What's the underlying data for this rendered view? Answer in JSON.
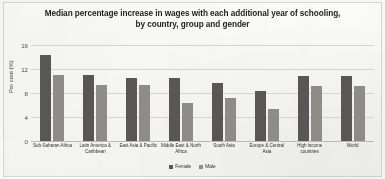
{
  "chart_data": {
    "type": "bar",
    "title": "Median percentage increase in wages with each additional year of schooling, by country, group and gender",
    "title_lines": [
      "Median percentage increase in wages with each additional year of schooling,",
      "by country, group and gender"
    ],
    "xlabel": "",
    "ylabel": "Per cent (%)",
    "ylim": [
      0,
      16
    ],
    "yticks": [
      0,
      4,
      8,
      12,
      16
    ],
    "ytick_labels": [
      "0",
      "4",
      "8",
      "12",
      "16"
    ],
    "grid": true,
    "legend_position": "bottom",
    "categories": [
      "Sub-Saharan Africa",
      "Latin America & Caribbean",
      "East Asia & Pacific",
      "Middle East & North Africa",
      "South Asia",
      "Europe & Central Asia",
      "High income countries",
      "World"
    ],
    "series": [
      {
        "name": "Female",
        "color": "#595755",
        "values": [
          14.3,
          11.0,
          10.5,
          10.5,
          9.7,
          8.4,
          10.8,
          10.8
        ]
      },
      {
        "name": "Male",
        "color": "#8e8c89",
        "values": [
          11.0,
          9.4,
          9.3,
          6.3,
          7.2,
          5.3,
          9.2,
          9.2
        ]
      }
    ]
  }
}
